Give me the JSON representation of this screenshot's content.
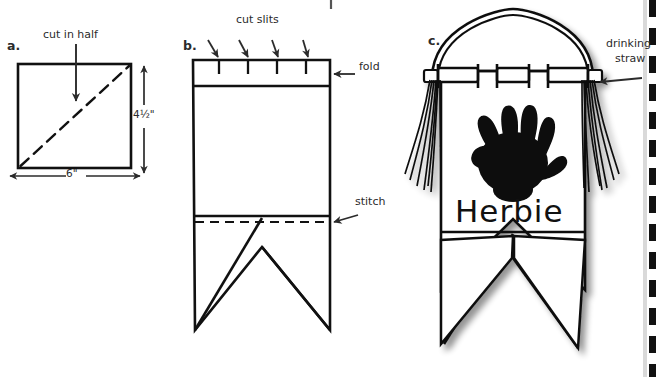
{
  "page": {
    "top_fragment_text": "(sketch c).",
    "background": "#ffffff",
    "ink": "#111111",
    "width": 657,
    "height": 377
  },
  "panels": [
    {
      "id": "a",
      "caption": "a.",
      "labels": {
        "cut_in_half": "cut in half",
        "height_dim": "4 1/2\"",
        "height_dim_display": "4½\"",
        "width_dim": "6\""
      },
      "shape": "rectangle-with-dashed-diagonal"
    },
    {
      "id": "b",
      "caption": "b.",
      "labels": {
        "cut_slits": "cut slits",
        "fold": "fold",
        "stitch": "stitch"
      },
      "slit_count": 4,
      "shape": "pennant-with-fold-band-and-swallowtail"
    },
    {
      "id": "c",
      "caption": "c.",
      "labels": {
        "drinking_straw_line1": "drinking",
        "drinking_straw_line2": "straw",
        "flag_name": "Herbie"
      },
      "decoration": "black-handprint",
      "tassels": 2,
      "shape": "finished-flag-on-straw-with-tassels"
    }
  ],
  "edge_marks": {
    "right_border": "dashed-vertical-scan-edge",
    "top_tick": "stray-scan-mark"
  },
  "icon_names": {
    "arrow_down": "arrow-down-icon",
    "arrow_left": "arrow-left-icon",
    "arrow_double_vertical": "double-arrow-vertical-icon",
    "arrow_double_horizontal": "double-arrow-horizontal-icon",
    "handprint": "handprint-icon",
    "straw": "drinking-straw-icon",
    "tassel": "tassel-icon"
  }
}
